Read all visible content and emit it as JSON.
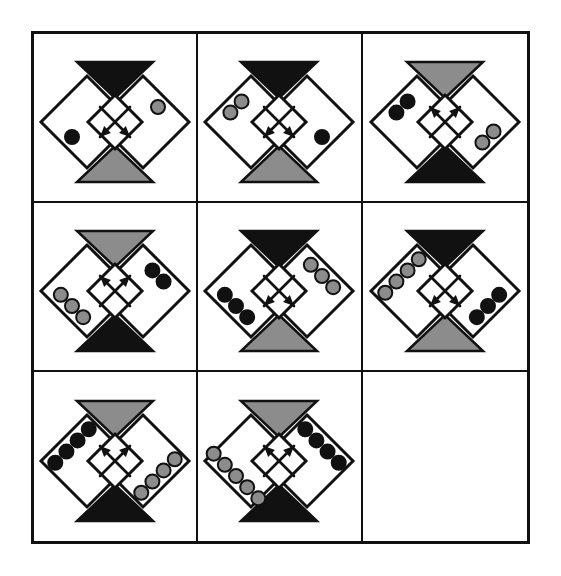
{
  "puzzle": {
    "title": "Matrix Reasoning Puzzle",
    "type": "3x3-matrix",
    "rows": 3,
    "columns": 3,
    "background_color": "#ffffff",
    "border_color": "#111111",
    "colors": {
      "black": "#111111",
      "gray": "#8c8c8c",
      "white": "#ffffff",
      "outline": "#111111"
    },
    "cells": [
      {
        "index": 1,
        "row": 1,
        "column": 1,
        "empty": false,
        "top_triangle_color": "black",
        "bottom_triangle_color": "gray",
        "arrow_direction": "down",
        "upper_dots": {
          "count": 1,
          "color": "gray",
          "side": "right"
        },
        "lower_dots": {
          "count": 1,
          "color": "black",
          "side": "left"
        }
      },
      {
        "index": 2,
        "row": 1,
        "column": 2,
        "empty": false,
        "top_triangle_color": "black",
        "bottom_triangle_color": "gray",
        "arrow_direction": "down",
        "upper_dots": {
          "count": 2,
          "color": "gray",
          "side": "left"
        },
        "lower_dots": {
          "count": 1,
          "color": "black",
          "side": "right"
        }
      },
      {
        "index": 3,
        "row": 1,
        "column": 3,
        "empty": false,
        "top_triangle_color": "gray",
        "bottom_triangle_color": "black",
        "arrow_direction": "up",
        "upper_dots": {
          "count": 2,
          "color": "black",
          "side": "left"
        },
        "lower_dots": {
          "count": 2,
          "color": "gray",
          "side": "right"
        }
      },
      {
        "index": 4,
        "row": 2,
        "column": 1,
        "empty": false,
        "top_triangle_color": "gray",
        "bottom_triangle_color": "black",
        "arrow_direction": "up",
        "upper_dots": {
          "count": 2,
          "color": "black",
          "side": "right"
        },
        "lower_dots": {
          "count": 3,
          "color": "gray",
          "side": "left"
        }
      },
      {
        "index": 5,
        "row": 2,
        "column": 2,
        "empty": false,
        "top_triangle_color": "black",
        "bottom_triangle_color": "gray",
        "arrow_direction": "down",
        "upper_dots": {
          "count": 3,
          "color": "gray",
          "side": "right"
        },
        "lower_dots": {
          "count": 3,
          "color": "black",
          "side": "left"
        }
      },
      {
        "index": 6,
        "row": 2,
        "column": 3,
        "empty": false,
        "top_triangle_color": "black",
        "bottom_triangle_color": "gray",
        "arrow_direction": "down",
        "upper_dots": {
          "count": 4,
          "color": "gray",
          "side": "left"
        },
        "lower_dots": {
          "count": 3,
          "color": "black",
          "side": "right"
        }
      },
      {
        "index": 7,
        "row": 3,
        "column": 1,
        "empty": false,
        "top_triangle_color": "gray",
        "bottom_triangle_color": "black",
        "arrow_direction": "up",
        "upper_dots": {
          "count": 4,
          "color": "black",
          "side": "left"
        },
        "lower_dots": {
          "count": 4,
          "color": "gray",
          "side": "right"
        }
      },
      {
        "index": 8,
        "row": 3,
        "column": 2,
        "empty": false,
        "top_triangle_color": "gray",
        "bottom_triangle_color": "black",
        "arrow_direction": "up",
        "upper_dots": {
          "count": 4,
          "color": "black",
          "side": "right"
        },
        "lower_dots": {
          "count": 5,
          "color": "gray",
          "side": "left"
        }
      },
      {
        "index": 9,
        "row": 3,
        "column": 3,
        "empty": true,
        "label": ""
      }
    ]
  }
}
